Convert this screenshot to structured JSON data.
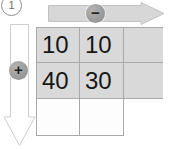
{
  "step": {
    "label": "1",
    "icon": "circled-number-badge"
  },
  "horizontal_arrow": {
    "direction": "right",
    "operator_label": "−",
    "operator_name": "minus",
    "badge_icon": "minus-circle-icon",
    "fill_color": "#d7d7d7",
    "stroke_color": "#bdbdbd"
  },
  "vertical_arrow": {
    "direction": "down",
    "operator_label": "+",
    "operator_name": "plus",
    "badge_icon": "plus-circle-icon",
    "fill_color": "#ffffff",
    "stroke_color": "#c9c9c9"
  },
  "grid": {
    "columns": 3,
    "rows": 3,
    "shaded_color": "#d9d9d9",
    "empty_color": "#fdfdfd",
    "line_color": "#a9a9a9",
    "cells": [
      [
        {
          "value": "10",
          "shaded": true
        },
        {
          "value": "10",
          "shaded": true
        },
        {
          "value": "",
          "shaded": true
        }
      ],
      [
        {
          "value": "40",
          "shaded": true
        },
        {
          "value": "30",
          "shaded": true
        },
        {
          "value": "",
          "shaded": true
        }
      ],
      [
        {
          "value": "",
          "shaded": false
        },
        {
          "value": "",
          "shaded": false
        },
        {
          "value": "",
          "shaded": false,
          "hidden": true
        }
      ]
    ]
  }
}
